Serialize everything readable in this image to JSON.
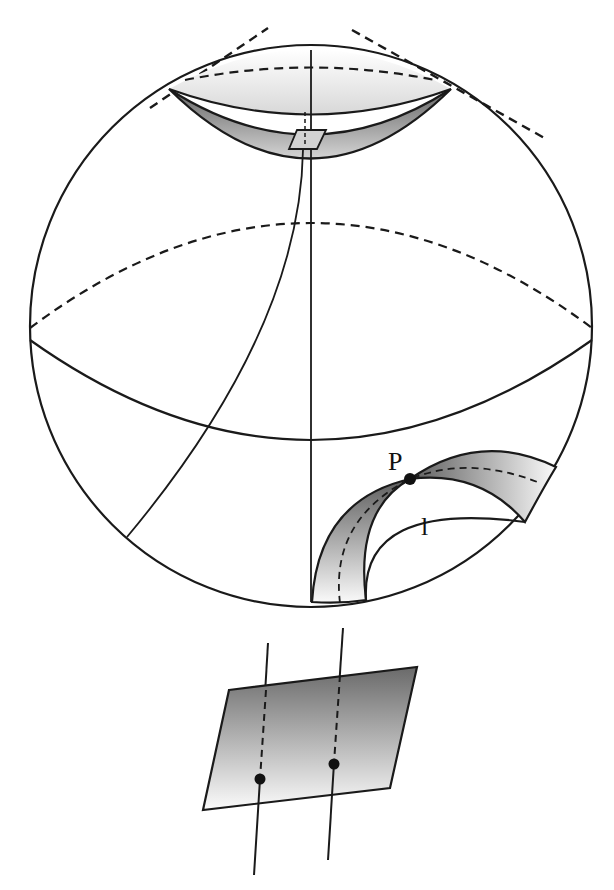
{
  "diagram": {
    "type": "geometry-illustration",
    "labels": {
      "point": "P",
      "line": "l"
    },
    "colors": {
      "stroke": "#1a1a1a",
      "shade_dark": "#707070",
      "shade_light": "#f2f2f2",
      "background": "#ffffff"
    }
  }
}
